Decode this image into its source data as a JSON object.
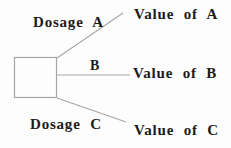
{
  "diagram": {
    "type": "decision-tree",
    "node": {
      "shape": "square"
    },
    "branches": [
      {
        "branch_label": "Dosage A",
        "outcome_label": "Value of A"
      },
      {
        "branch_label": "B",
        "outcome_label": "Value of B"
      },
      {
        "branch_label": "Dosage C",
        "outcome_label": "Value of C"
      }
    ],
    "colors": {
      "line": "#a6a6a6",
      "text": "#1b1b1b",
      "background": "#fdfdfd"
    }
  }
}
